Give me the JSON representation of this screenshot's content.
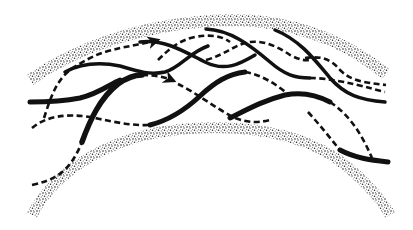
{
  "diagram": {
    "title": "",
    "colors": {
      "background": "#ffffff",
      "ink": "#111111",
      "stipple": "#222222"
    },
    "walls": [
      {
        "id": "outer-wall",
        "style": "stippled"
      },
      {
        "id": "inner-wall",
        "style": "stippled"
      }
    ],
    "strands": [
      {
        "id": "strand-1",
        "style": "solid"
      },
      {
        "id": "strand-2",
        "style": "solid"
      },
      {
        "id": "strand-3",
        "style": "solid"
      },
      {
        "id": "strand-4",
        "style": "dashed",
        "arrow": true
      },
      {
        "id": "strand-5",
        "style": "dashed",
        "arrow": true
      },
      {
        "id": "strand-6",
        "style": "dashed"
      },
      {
        "id": "strand-7",
        "style": "dashed"
      }
    ],
    "labels": []
  }
}
